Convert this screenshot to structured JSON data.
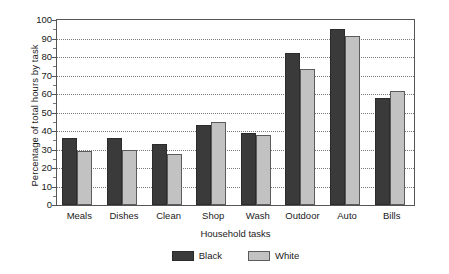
{
  "chart_data": {
    "type": "bar",
    "title": "",
    "xlabel": "Household tasks",
    "ylabel": "Percentage of total hours by task",
    "categories": [
      "Meals",
      "Dishes",
      "Clean",
      "Shop",
      "Wash",
      "Outdoor",
      "Auto",
      "Bills"
    ],
    "series": [
      {
        "name": "Black",
        "color": "#3a3a3a",
        "values": [
          36,
          36,
          33,
          43.5,
          39,
          82,
          95,
          58
        ]
      },
      {
        "name": "White",
        "color": "#c2c2c2",
        "values": [
          29,
          30,
          27.5,
          45,
          38,
          73.5,
          91.5,
          61.5
        ]
      }
    ],
    "ylim": [
      0,
      100
    ],
    "yticks": [
      0,
      10,
      20,
      30,
      40,
      50,
      60,
      70,
      80,
      90,
      100
    ],
    "ytick_labels": [
      "0",
      "10",
      "20",
      "30",
      "40",
      "50",
      "60",
      "70",
      "80",
      "90",
      "100"
    ],
    "grid": true,
    "grid_axis": "y",
    "grid_style": "dotted",
    "legend_position": "bottom-center",
    "frame": true
  }
}
